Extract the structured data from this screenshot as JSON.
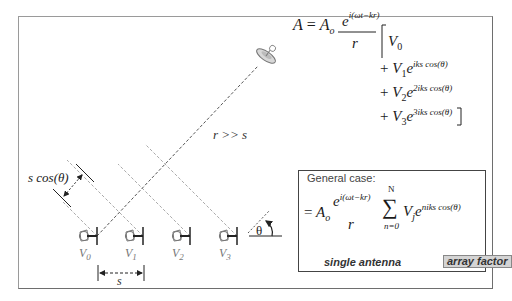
{
  "diagram": {
    "main_equation": {
      "lhs": "A",
      "equals": "=",
      "amplitude": "A",
      "amplitude_sub": "o",
      "numerator_base": "e",
      "numerator_exp": "i(ωt−kr)",
      "denominator": "r",
      "terms": [
        {
          "sign": "",
          "coef": "V",
          "coef_sub": "0",
          "exp": ""
        },
        {
          "sign": "+",
          "coef": "V",
          "coef_sub": "1",
          "exp": "iks cos(θ)"
        },
        {
          "sign": "+",
          "coef": "V",
          "coef_sub": "2",
          "exp": "2iks cos(θ)"
        },
        {
          "sign": "+",
          "coef": "V",
          "coef_sub": "3",
          "exp": "3iks cos(θ)"
        }
      ],
      "open_bracket": "[",
      "close_bracket": "]"
    },
    "ray_label": "r >> s",
    "path_difference_label": "s cos(θ)",
    "spacing_label": "s",
    "angle_label": "θ",
    "antennas": [
      {
        "label": "V",
        "sub": "0"
      },
      {
        "label": "V",
        "sub": "1"
      },
      {
        "label": "V",
        "sub": "2"
      },
      {
        "label": "V",
        "sub": "3"
      }
    ],
    "general_case": {
      "heading": "General case:",
      "equals": "=",
      "amplitude": "A",
      "amplitude_sub": "o",
      "numerator_base": "e",
      "numerator_exp": "i(ωt−kr)",
      "denominator": "r",
      "sum_symbol": "∑",
      "sum_upper": "N",
      "sum_lower": "n=0",
      "term_coef": "V",
      "term_sub": "j",
      "term_base": "e",
      "term_exp": "niks cos(θ)",
      "brace_left_label": "single antenna",
      "brace_right_label": "array factor"
    },
    "colors": {
      "frame": "#6e6e6e",
      "ray": "#555555",
      "wavefront": "#aaaaaa",
      "antenna": "#777777",
      "array_factor_bg": "#d4d4d4"
    }
  }
}
